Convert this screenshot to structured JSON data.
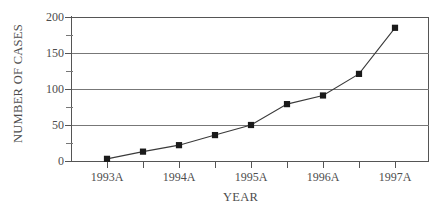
{
  "chart_data": {
    "type": "line",
    "title": "",
    "xlabel": "YEAR",
    "ylabel": "NUMBER OF CASES",
    "ylim": [
      0,
      200
    ],
    "y_ticks_major": [
      0,
      50,
      100,
      150,
      200
    ],
    "y_ticks_minor": [
      25,
      75,
      125,
      175
    ],
    "grid": "horizontal",
    "legend": "none",
    "x_tick_labels": [
      "1993A",
      "",
      "1994A",
      "",
      "1995A",
      "",
      "1996A",
      "",
      "1997A"
    ],
    "categories": [
      "1993A",
      "1993B",
      "1994A",
      "1994B",
      "1995A",
      "1995B",
      "1996A",
      "1996B",
      "1997A"
    ],
    "values": [
      3,
      13,
      22,
      36,
      50,
      79,
      91,
      121,
      185
    ],
    "marker": "filled-square",
    "marker_color": "#1a1a1a",
    "line_color": "#3a3a3a",
    "background_color": "#ffffff",
    "axis_color": "#555555",
    "gridline_color": "#777777"
  },
  "axes": {
    "y_title": "NUMBER OF CASES",
    "x_title": "YEAR",
    "y_labels": [
      "200",
      "150",
      "100",
      "50",
      "0"
    ]
  }
}
